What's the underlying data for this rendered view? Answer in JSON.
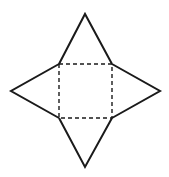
{
  "diagram": {
    "width": 169,
    "height": 177,
    "stroke_color": "#1a1a1a",
    "background": "#ffffff",
    "base_square": {
      "x1": 59,
      "y1": 64,
      "x2": 112,
      "y2": 118,
      "style": "dashed"
    },
    "apexes": {
      "top": [
        85,
        14
      ],
      "right": [
        160,
        91
      ],
      "bottom": [
        85,
        167
      ],
      "left": [
        11,
        91
      ]
    }
  }
}
